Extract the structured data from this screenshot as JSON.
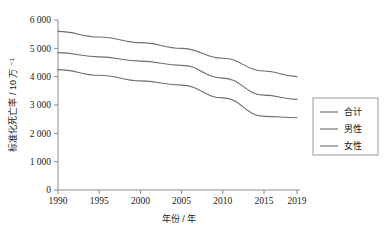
{
  "chart_data": {
    "type": "line",
    "title": "",
    "xlabel": "年份 / 年",
    "ylabel": "标准化死亡率 / 10 万 ⁻¹",
    "x": [
      1990,
      1995,
      2000,
      2005,
      2010,
      2015,
      2019
    ],
    "xlim": [
      1990,
      2019
    ],
    "ylim": [
      0,
      6000
    ],
    "xticks": [
      "1990",
      "1995",
      "2000",
      "2005",
      "2010",
      "2015",
      "2019"
    ],
    "xtick_values": [
      1990,
      1995,
      2000,
      2005,
      2010,
      2015,
      2019
    ],
    "yticks": [
      "0",
      "1 000",
      "2 000",
      "3 000",
      "4 000",
      "5 000",
      "6 000"
    ],
    "ytick_values": [
      0,
      1000,
      2000,
      3000,
      4000,
      5000,
      6000
    ],
    "grid": false,
    "legend_position": "right",
    "series": [
      {
        "name": "合计",
        "color": "#6e6e6e",
        "values": [
          5600,
          5400,
          5200,
          5000,
          4650,
          4200,
          4000
        ]
      },
      {
        "name": "男性",
        "color": "#6e6e6e",
        "values": [
          4850,
          4700,
          4550,
          4400,
          3950,
          3350,
          3200
        ]
      },
      {
        "name": "女性",
        "color": "#6e6e6e",
        "values": [
          4250,
          4050,
          3850,
          3700,
          3250,
          2600,
          2550
        ]
      }
    ]
  },
  "legend": {
    "items": [
      {
        "label": "合计"
      },
      {
        "label": "男性"
      },
      {
        "label": "女性"
      }
    ]
  },
  "colors": {
    "axis": "#8c8c8c",
    "line": "#6e6e6e",
    "text": "#1a1a1a",
    "background": "#ffffff"
  }
}
